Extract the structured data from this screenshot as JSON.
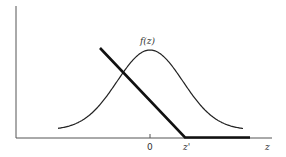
{
  "figure": {
    "type": "function-diagram",
    "curve_label": "f(z)",
    "x_axis_label": "z",
    "tick_labels": {
      "origin": "0",
      "threshold": "z'"
    },
    "curves": [
      {
        "name": "density",
        "description": "bell-shaped density f(z) centered at 0",
        "center": 0
      },
      {
        "name": "hinge",
        "description": "piecewise linear: decreasing line reaching zero at z', then flat at zero",
        "zero_at": "z'"
      }
    ]
  }
}
